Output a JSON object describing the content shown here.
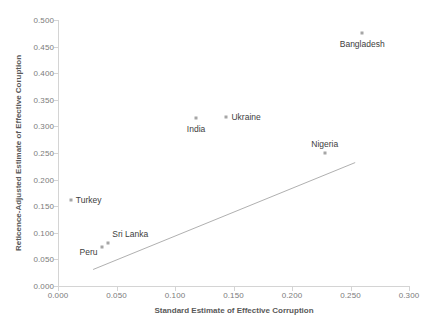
{
  "chart_data": {
    "type": "scatter",
    "title": "",
    "xlabel": "Standard Estimate of Effective Corruption",
    "ylabel": "Reticence-Adjusted Estimate of Effective Coruption",
    "xlim": [
      0.0,
      0.3
    ],
    "ylim": [
      0.0,
      0.5
    ],
    "xticks": [
      "0.000",
      "0.050",
      "0.100",
      "0.150",
      "0.200",
      "0.250",
      "0.300"
    ],
    "xtick_values": [
      0.0,
      0.05,
      0.1,
      0.15,
      0.2,
      0.25,
      0.3
    ],
    "yticks": [
      "0.000",
      "0.050",
      "0.100",
      "0.150",
      "0.200",
      "0.250",
      "0.300",
      "0.350",
      "0.400",
      "0.450",
      "0.500"
    ],
    "ytick_values": [
      0.0,
      0.05,
      0.1,
      0.15,
      0.2,
      0.25,
      0.3,
      0.35,
      0.4,
      0.45,
      0.5
    ],
    "grid": false,
    "legend": "none",
    "marker_color": "#a6a6a6",
    "trend_line_color": "#b0b0b0",
    "points": [
      {
        "label": "Bangladesh",
        "x": 0.26,
        "y": 0.475,
        "label_dx": 0,
        "label_dy": 11,
        "label_anchor": "center"
      },
      {
        "label": "Ukraine",
        "x": 0.144,
        "y": 0.318,
        "label_dx": 5,
        "label_dy": 0,
        "label_anchor": "left"
      },
      {
        "label": "India",
        "x": 0.118,
        "y": 0.316,
        "label_dx": 0,
        "label_dy": 11,
        "label_anchor": "center"
      },
      {
        "label": "Nigeria",
        "x": 0.228,
        "y": 0.25,
        "label_dx": 0,
        "label_dy": -9,
        "label_anchor": "center"
      },
      {
        "label": "Turkey",
        "x": 0.011,
        "y": 0.162,
        "label_dx": 5,
        "label_dy": 0,
        "label_anchor": "left"
      },
      {
        "label": "Sri Lanka",
        "x": 0.043,
        "y": 0.081,
        "label_dx": 4,
        "label_dy": -9,
        "label_anchor": "left"
      },
      {
        "label": "Peru",
        "x": 0.038,
        "y": 0.073,
        "label_dx": -5,
        "label_dy": 5,
        "label_anchor": "right"
      }
    ],
    "trend_line": {
      "x0": 0.03,
      "y0": 0.031,
      "x1": 0.254,
      "y1": 0.232
    }
  }
}
